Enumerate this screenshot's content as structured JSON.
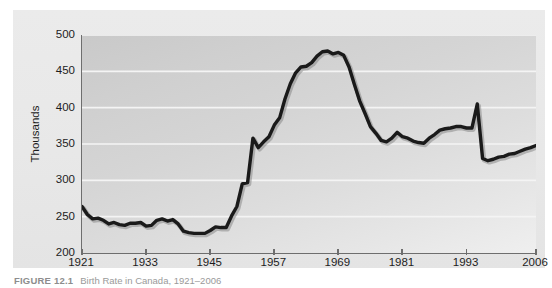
{
  "figure": {
    "caption_label": "FIGURE 12.1",
    "caption_text": "Birth Rate in Canada, 1921–2006"
  },
  "axes": {
    "y_title": "Thousands",
    "y_ticks": [
      "200",
      "250",
      "300",
      "350",
      "400",
      "450",
      "500"
    ],
    "x_ticks": [
      "1921",
      "1933",
      "1945",
      "1957",
      "1969",
      "1981",
      "1993",
      "2006"
    ]
  },
  "colors": {
    "line": "#1a1a1a",
    "plot_bg_light": "#efefef",
    "plot_bg_dark": "#c9c9c9",
    "gridline": "#f4f4f4",
    "axis": "#6e6e6e",
    "panel_bg": "#e8e8e8",
    "text": "#1d1d1d",
    "caption": "#9a9a9a"
  },
  "chart_data": {
    "type": "line",
    "title": "Birth Rate in Canada, 1921–2006",
    "xlabel": "",
    "ylabel": "Thousands",
    "xlim": [
      1921,
      2006
    ],
    "ylim": [
      200,
      500
    ],
    "yticks": [
      200,
      250,
      300,
      350,
      400,
      450,
      500
    ],
    "xticks": [
      1921,
      1933,
      1945,
      1957,
      1969,
      1981,
      1993,
      2006
    ],
    "grid": "horizontal",
    "legend": "none",
    "series": [
      {
        "name": "Births",
        "x": [
          1921,
          1922,
          1923,
          1924,
          1925,
          1926,
          1927,
          1928,
          1929,
          1930,
          1931,
          1932,
          1933,
          1934,
          1935,
          1936,
          1937,
          1938,
          1939,
          1940,
          1941,
          1942,
          1943,
          1944,
          1945,
          1946,
          1947,
          1948,
          1949,
          1950,
          1951,
          1952,
          1953,
          1954,
          1955,
          1956,
          1957,
          1958,
          1959,
          1960,
          1961,
          1962,
          1963,
          1964,
          1965,
          1966,
          1967,
          1968,
          1969,
          1970,
          1971,
          1972,
          1973,
          1974,
          1975,
          1976,
          1977,
          1978,
          1979,
          1980,
          1981,
          1982,
          1983,
          1984,
          1985,
          1986,
          1987,
          1988,
          1989,
          1990,
          1991,
          1992,
          1993,
          1994,
          1995,
          1996,
          1997,
          1998,
          1999,
          2000,
          2001,
          2002,
          2003,
          2004,
          2005,
          2006
        ],
        "y": [
          264,
          253,
          247,
          248,
          245,
          240,
          242,
          239,
          238,
          241,
          241,
          242,
          237,
          238,
          245,
          247,
          244,
          246,
          240,
          230,
          228,
          227,
          227,
          227,
          231,
          236,
          235,
          235,
          251,
          264,
          295,
          297,
          358,
          345,
          353,
          360,
          376,
          386,
          412,
          433,
          448,
          456,
          457,
          462,
          471,
          477,
          478,
          474,
          476,
          472,
          456,
          432,
          409,
          392,
          374,
          365,
          355,
          353,
          358,
          366,
          360,
          358,
          354,
          352,
          351,
          358,
          363,
          369,
          371,
          372,
          374,
          374,
          372,
          372,
          405,
          330,
          327,
          329,
          332,
          333,
          336,
          337,
          340,
          343,
          345,
          348
        ]
      }
    ]
  }
}
